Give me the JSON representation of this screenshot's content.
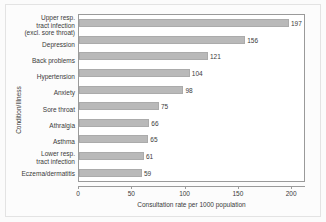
{
  "chart_data": {
    "type": "bar",
    "orientation": "horizontal",
    "title": "",
    "xlabel": "Consultation rate per 1000 population",
    "ylabel": "Condition/Illness",
    "xlim": [
      0,
      213
    ],
    "xticks": [
      0,
      50,
      100,
      150,
      200
    ],
    "xticklabels": [
      "0",
      "50",
      "100",
      "150",
      "200"
    ],
    "grid": false,
    "legend": null,
    "bar_color": "#b9b9b9",
    "categories": [
      "Upper resp. tract infection (excl. sore throat)",
      "Depression",
      "Back problems",
      "Hypertension",
      "Anxiety",
      "Sore throat",
      "Athralgia",
      "Asthma",
      "Lower resp. tract infection",
      "Eczema/dermatitis"
    ],
    "values": [
      197,
      156,
      121,
      104,
      98,
      75,
      66,
      65,
      61,
      59
    ],
    "value_labels": [
      "197",
      "156",
      "121",
      "104",
      "98",
      "75",
      "66",
      "65",
      "61",
      "59"
    ],
    "category_lines": [
      [
        "Upper resp.",
        "tract infection",
        "(excl. sore throat)"
      ],
      [
        "Depression"
      ],
      [
        "Back problems"
      ],
      [
        "Hypertension"
      ],
      [
        "Anxiety"
      ],
      [
        "Sore throat"
      ],
      [
        "Athralgia"
      ],
      [
        "Asthma"
      ],
      [
        "Lower resp.",
        "tract infection"
      ],
      [
        "Eczema/dermatitis"
      ]
    ]
  }
}
